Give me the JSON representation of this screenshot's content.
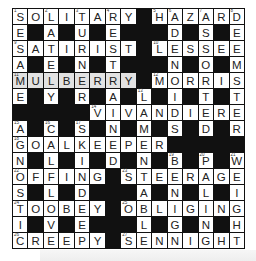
{
  "puzzle": {
    "size": 15,
    "highlight_color": "#e2e2e2",
    "grid": [
      "SOLITARY#HAZARD",
      "E#A#U#E###D#S#E",
      "SATIRIST#LESSEE",
      "A#E#N#T###N#O#M",
      "MULBERRY#MORRIS",
      "E#Y#R#A#L#I#T#T",
      "#####VIVANDIERE",
      "A#C#S#N#M#S#D#R",
      "GOALKEEPER#####",
      "N#L#I#D#N#B#P#W",
      "OFFING#STEERAGE",
      "S#L#D###A#N#L#I",
      "TOOBEY#OBLIGING",
      "I#V#E###L#G#N#H",
      "CREEPY#SENNIGHT"
    ],
    "numbers": {
      "0,0": "1",
      "0,2": "2",
      "0,4": "3",
      "0,6": "4",
      "0,9": "5",
      "0,10": "6",
      "0,12": "7",
      "0,14": "8",
      "2,0": "9",
      "2,9": "10",
      "4,0": "11",
      "4,9": "12",
      "5,8": "13",
      "6,5": "14",
      "7,0": "15",
      "7,2": "16",
      "7,4": "17",
      "8,0": "18",
      "9,10": "19",
      "9,12": "20",
      "9,14": "21",
      "10,0": "22",
      "10,7": "23",
      "12,0": "24",
      "12,7": "25",
      "14,0": "26",
      "14,7": "27"
    },
    "highlighted": {
      "row": 4,
      "from": 0,
      "to": 7,
      "word": "MULBERRY"
    },
    "answers": {
      "across": [
        {
          "num": "1",
          "answer": "SOLITARY"
        },
        {
          "num": "5",
          "answer": "HAZARD"
        },
        {
          "num": "9",
          "answer": "SATIRIST"
        },
        {
          "num": "10",
          "answer": "LESSEE"
        },
        {
          "num": "11",
          "answer": "MULBERRY"
        },
        {
          "num": "12",
          "answer": "MORRIS"
        },
        {
          "num": "14",
          "answer": "VIVANDIERE"
        },
        {
          "num": "18",
          "answer": "GOALKEEPER"
        },
        {
          "num": "22",
          "answer": "OFFING"
        },
        {
          "num": "23",
          "answer": "STEERAGE"
        },
        {
          "num": "24",
          "answer": "TOOBEY"
        },
        {
          "num": "25",
          "answer": "OBLIGING"
        },
        {
          "num": "26",
          "answer": "CREEPY"
        },
        {
          "num": "27",
          "answer": "SENNIGHT"
        }
      ]
    }
  }
}
